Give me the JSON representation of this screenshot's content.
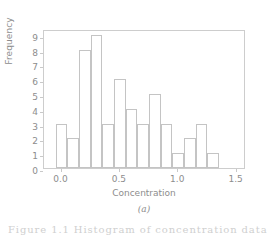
{
  "figure": {
    "subcaption": "(a)",
    "caption_partial": "Figure 1.1  Histogram of concentration data",
    "axis_color": "#cdcdcd",
    "text_color": "#8d8d8d",
    "bar_edge_color": "#c4c4c4",
    "background": "#ffffff"
  },
  "chart_data": {
    "type": "bar",
    "title": "",
    "subtitle": "",
    "xlabel": "Concentration",
    "ylabel": "Frequency",
    "xlim": [
      -0.15,
      1.58
    ],
    "ylim": [
      0,
      9.4
    ],
    "xticks": [
      0.0,
      0.5,
      1.0,
      1.5
    ],
    "xticklabels": [
      "0.0",
      "0.5",
      "1.0",
      "1.5"
    ],
    "yticks": [
      0,
      1,
      2,
      3,
      4,
      5,
      6,
      7,
      8,
      9
    ],
    "yticklabels": [
      "0",
      "1",
      "2",
      "3",
      "4",
      "5",
      "6",
      "7",
      "8",
      "9"
    ],
    "grid": false,
    "legend": null,
    "bin_width": 0.1,
    "bin_edges": [
      -0.05,
      0.05,
      0.15,
      0.25,
      0.35,
      0.45,
      0.55,
      0.65,
      0.75,
      0.85,
      0.95,
      1.05,
      1.15,
      1.25,
      1.35
    ],
    "categories": [
      "-0.05",
      "0.05",
      "0.15",
      "0.25",
      "0.35",
      "0.45",
      "0.55",
      "0.65",
      "0.75",
      "0.85",
      "0.95",
      "1.05",
      "1.15",
      "1.25"
    ],
    "values": [
      3,
      2,
      8,
      9,
      3,
      6,
      4,
      3,
      5,
      3,
      1,
      2,
      3,
      1
    ],
    "annotations": []
  }
}
